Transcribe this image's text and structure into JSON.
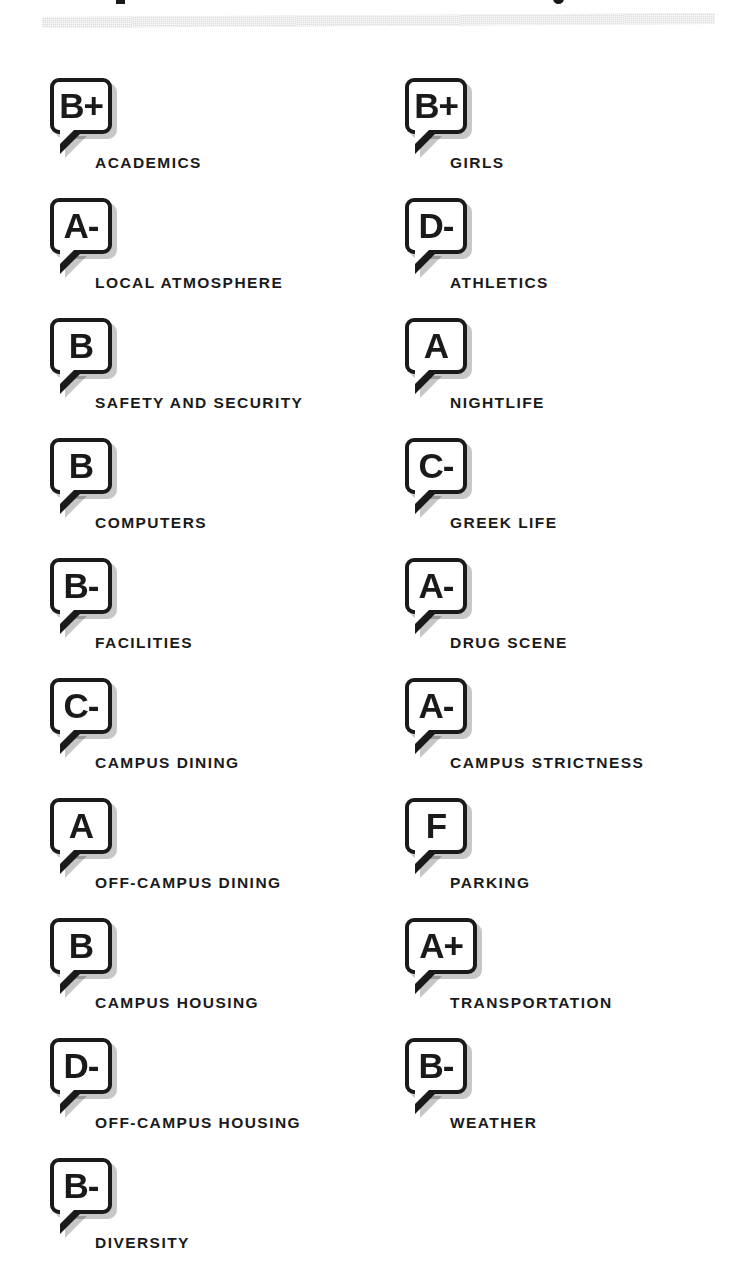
{
  "page": {
    "background_color": "#ffffff",
    "ink_color": "#1a1a1a",
    "divider_color": "#dcdcdc",
    "shadow_color": "rgba(0,0,0,0.22)"
  },
  "header": {
    "divider_present": true,
    "title_cut_off": true
  },
  "report_card": {
    "badge_shape": "speech-bubble",
    "columns": [
      {
        "name": "left-column",
        "items": [
          {
            "grade": "B+",
            "label": "ACADEMICS"
          },
          {
            "grade": "A-",
            "label": "LOCAL ATMOSPHERE"
          },
          {
            "grade": "B",
            "label": "SAFETY AND SECURITY"
          },
          {
            "grade": "B",
            "label": "COMPUTERS"
          },
          {
            "grade": "B-",
            "label": "FACILITIES"
          },
          {
            "grade": "C-",
            "label": "CAMPUS DINING"
          },
          {
            "grade": "A",
            "label": "OFF-CAMPUS DINING"
          },
          {
            "grade": "B",
            "label": "CAMPUS HOUSING"
          },
          {
            "grade": "D-",
            "label": "OFF-CAMPUS HOUSING"
          },
          {
            "grade": "B-",
            "label": "DIVERSITY"
          }
        ]
      },
      {
        "name": "right-column",
        "items": [
          {
            "grade": "B+",
            "label": "GIRLS"
          },
          {
            "grade": "D-",
            "label": "ATHLETICS"
          },
          {
            "grade": "A",
            "label": "NIGHTLIFE"
          },
          {
            "grade": "C-",
            "label": "GREEK LIFE"
          },
          {
            "grade": "A-",
            "label": "DRUG SCENE"
          },
          {
            "grade": "A-",
            "label": "CAMPUS STRICTNESS"
          },
          {
            "grade": "F",
            "label": "PARKING"
          },
          {
            "grade": "A+",
            "label": "TRANSPORTATION"
          },
          {
            "grade": "B-",
            "label": "WEATHER"
          }
        ]
      }
    ]
  }
}
